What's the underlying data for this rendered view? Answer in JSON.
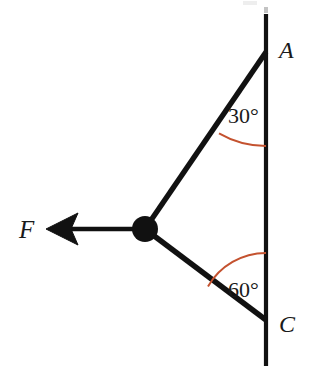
{
  "figure": {
    "background_color": "#ffffff",
    "stroke_color": "#111111",
    "arc_color": "#c4522f",
    "label_color": "#1a1a1a"
  },
  "labels": {
    "point_a": "A",
    "point_c": "C",
    "force": "F",
    "angle_top": "30°",
    "angle_bottom": "60°"
  },
  "geometry": {
    "wall_line": {
      "x": 266,
      "y_top": 14,
      "y_bottom": 366
    },
    "point_a": {
      "x": 266,
      "y": 52
    },
    "point_c": {
      "x": 266,
      "y": 320
    },
    "joint": {
      "x": 145,
      "y": 229,
      "radius": 13
    },
    "force_arrow": {
      "tail_x": 142,
      "tail_y": 229,
      "tip_x": 46,
      "tip_y": 229
    },
    "angle_top_degrees": 30,
    "angle_bottom_degrees": 60
  },
  "label_positions": {
    "point_a": {
      "x": 279,
      "y": 58
    },
    "point_c": {
      "x": 279,
      "y": 332
    },
    "force": {
      "x": 19,
      "y": 238
    },
    "angle_top": {
      "x": 228,
      "y": 123
    },
    "angle_bottom": {
      "x": 228,
      "y": 297
    }
  }
}
